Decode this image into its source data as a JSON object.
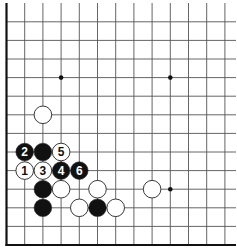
{
  "board": {
    "type": "go-board-corner",
    "corner": "bottom-left",
    "columns_visible": 13,
    "rows_visible": 14,
    "colors": {
      "black": "#111111",
      "white": "#ffffff",
      "line": "#555555",
      "edge": "#111111"
    }
  },
  "star_points": [
    {
      "col": 3,
      "row": 9
    },
    {
      "col": 9,
      "row": 9
    },
    {
      "col": 9,
      "row": 3
    }
  ],
  "stones": [
    {
      "col": 2,
      "row": 7,
      "color": "white",
      "label": ""
    },
    {
      "col": 1,
      "row": 5,
      "color": "black",
      "label": "2"
    },
    {
      "col": 2,
      "row": 5,
      "color": "black",
      "label": ""
    },
    {
      "col": 3,
      "row": 5,
      "color": "white",
      "label": "5"
    },
    {
      "col": 1,
      "row": 4,
      "color": "white",
      "label": "1"
    },
    {
      "col": 2,
      "row": 4,
      "color": "white",
      "label": "3"
    },
    {
      "col": 3,
      "row": 4,
      "color": "black",
      "label": "4"
    },
    {
      "col": 4,
      "row": 4,
      "color": "black",
      "label": "6"
    },
    {
      "col": 2,
      "row": 3,
      "color": "black",
      "label": ""
    },
    {
      "col": 3,
      "row": 3,
      "color": "white",
      "label": ""
    },
    {
      "col": 5,
      "row": 3,
      "color": "white",
      "label": ""
    },
    {
      "col": 8,
      "row": 3,
      "color": "white",
      "label": ""
    },
    {
      "col": 2,
      "row": 2,
      "color": "black",
      "label": ""
    },
    {
      "col": 4,
      "row": 2,
      "color": "white",
      "label": ""
    },
    {
      "col": 5,
      "row": 2,
      "color": "black",
      "label": ""
    },
    {
      "col": 6,
      "row": 2,
      "color": "white",
      "label": ""
    }
  ]
}
